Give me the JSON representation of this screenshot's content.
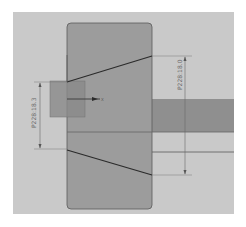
{
  "viewport": {
    "background_color": "#c9c9c9",
    "outer_color": "#ffffff"
  },
  "part": {
    "body_fill": "#9c9c9c",
    "body_stroke": "#5a5a5a",
    "shaft_fill": "#8e8e8e",
    "profile_stroke": "#2a2a2a"
  },
  "dimensions": {
    "left": {
      "label": "P228:18.3"
    },
    "right": {
      "label": "P228:18.0"
    }
  },
  "sketch_origin": {
    "axis_label": "X"
  }
}
